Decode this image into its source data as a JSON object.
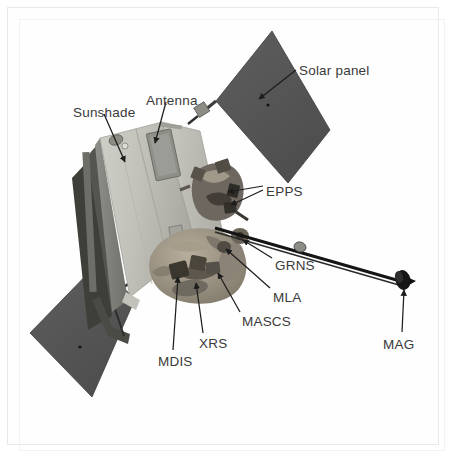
{
  "figure": {
    "kind": "labelled-diagram",
    "background_color": "#ffffff",
    "frame_color": "#e9e9e9",
    "label_color": "#3a3a3a",
    "body_color": "#b9b9b5",
    "body_shadow_color": "#8e8e8a",
    "solar_panel_color": "#565656",
    "instrument_color": "#9a9287",
    "boom_color": "#1a1a1a"
  },
  "labels": [
    {
      "id": "solar-panel",
      "text": "Solar panel",
      "x": 299,
      "y": 64,
      "anchor": "start"
    },
    {
      "id": "antenna",
      "text": "Antenna",
      "x": 146,
      "y": 94,
      "anchor": "start"
    },
    {
      "id": "sunshade",
      "text": "Sunshade",
      "x": 73,
      "y": 106,
      "anchor": "start"
    },
    {
      "id": "epps",
      "text": "EPPS",
      "x": 266,
      "y": 185,
      "anchor": "start"
    },
    {
      "id": "grns",
      "text": "GRNS",
      "x": 275,
      "y": 259,
      "anchor": "start"
    },
    {
      "id": "mla",
      "text": "MLA",
      "x": 273,
      "y": 291,
      "anchor": "start"
    },
    {
      "id": "mascs",
      "text": "MASCS",
      "x": 242,
      "y": 315,
      "anchor": "start"
    },
    {
      "id": "xrs",
      "text": "XRS",
      "x": 199,
      "y": 337,
      "anchor": "start"
    },
    {
      "id": "mdis",
      "text": "MDIS",
      "x": 158,
      "y": 355,
      "anchor": "start"
    },
    {
      "id": "mag",
      "text": "MAG",
      "x": 383,
      "y": 338,
      "anchor": "start"
    }
  ],
  "leaders": [
    {
      "id": "leader-solar-panel",
      "from": [
        296,
        70
      ],
      "to": [
        259,
        99
      ]
    },
    {
      "id": "leader-antenna",
      "from": [
        166,
        102
      ],
      "to": [
        155,
        143
      ]
    },
    {
      "id": "leader-sunshade",
      "from": [
        104,
        114
      ],
      "to": [
        125,
        162
      ]
    },
    {
      "id": "leader-epps-upper",
      "from": [
        263,
        186
      ],
      "to": [
        228,
        192
      ]
    },
    {
      "id": "leader-epps-lower",
      "from": [
        263,
        190
      ],
      "to": [
        231,
        205
      ]
    },
    {
      "id": "leader-grns",
      "from": [
        272,
        258
      ],
      "to": [
        243,
        240
      ]
    },
    {
      "id": "leader-mla",
      "from": [
        270,
        288
      ],
      "to": [
        226,
        249
      ]
    },
    {
      "id": "leader-mascs",
      "from": [
        240,
        312
      ],
      "to": [
        218,
        273
      ]
    },
    {
      "id": "leader-xrs",
      "from": [
        203,
        333
      ],
      "to": [
        196,
        283
      ]
    },
    {
      "id": "leader-mdis",
      "from": [
        173,
        350
      ],
      "to": [
        178,
        277
      ]
    },
    {
      "id": "leader-mag",
      "from": [
        402,
        332
      ],
      "to": [
        404,
        290
      ]
    }
  ]
}
